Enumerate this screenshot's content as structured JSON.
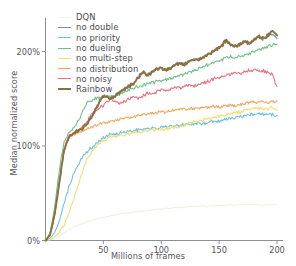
{
  "chart_data": {
    "type": "line",
    "title": "",
    "xlabel": "Millions of frames",
    "ylabel": "Median normalized score",
    "xlim": [
      0,
      200
    ],
    "ylim": [
      0,
      231
    ],
    "xticks": [
      50,
      100,
      150,
      200
    ],
    "xtick_labels": [
      "50",
      "100",
      "150",
      "200"
    ],
    "yticks": [
      0,
      100,
      200
    ],
    "ytick_labels": [
      "0%",
      "100%",
      "200%"
    ],
    "grid": false,
    "legend_position": "upper-left",
    "x": [
      0,
      4,
      8,
      12,
      16,
      20,
      24,
      28,
      32,
      36,
      40,
      44,
      48,
      52,
      56,
      60,
      64,
      68,
      72,
      76,
      80,
      84,
      88,
      92,
      96,
      100,
      104,
      108,
      112,
      116,
      120,
      124,
      128,
      132,
      136,
      140,
      144,
      148,
      152,
      156,
      160,
      164,
      168,
      172,
      176,
      180,
      184,
      188,
      192,
      196,
      200
    ],
    "series": [
      {
        "name": "DQN",
        "color": "#f4f1e4",
        "width": 1.2,
        "values": [
          0,
          1,
          3,
          5,
          8,
          11,
          14,
          16,
          18,
          20,
          21,
          23,
          24,
          25,
          26,
          27,
          28,
          29,
          29,
          30,
          31,
          31,
          32,
          32,
          33,
          33,
          34,
          34,
          35,
          35,
          35,
          36,
          36,
          36,
          37,
          36,
          37,
          37,
          37,
          37,
          38,
          37,
          38,
          38,
          38,
          38,
          38,
          37,
          38,
          38,
          38
        ]
      },
      {
        "name": "no double",
        "color": "#7a8fa6",
        "width": 1.1,
        "values": [
          0,
          6,
          28,
          62,
          95,
          110,
          113,
          116,
          119,
          124,
          131,
          141,
          150,
          153,
          150,
          152,
          157,
          160,
          163,
          166,
          172,
          178,
          175,
          178,
          181,
          183,
          180,
          183,
          186,
          188,
          186,
          189,
          192,
          191,
          193,
          196,
          199,
          203,
          206,
          212,
          207,
          205,
          208,
          211,
          209,
          212,
          215,
          213,
          216,
          219,
          214
        ]
      },
      {
        "name": "no priority",
        "color": "#6fc3e0",
        "width": 1.1,
        "values": [
          0,
          2,
          8,
          20,
          38,
          56,
          70,
          80,
          88,
          94,
          99,
          103,
          107,
          110,
          112,
          113,
          114,
          115,
          115,
          116,
          117,
          117,
          118,
          119,
          119,
          120,
          120,
          121,
          121,
          122,
          122,
          123,
          123,
          124,
          124,
          125,
          126,
          126,
          127,
          128,
          129,
          130,
          131,
          132,
          133,
          133,
          134,
          134,
          133,
          133,
          132
        ]
      },
      {
        "name": "no dueling",
        "color": "#72c18a",
        "width": 1.1,
        "values": [
          0,
          8,
          36,
          76,
          104,
          113,
          118,
          126,
          136,
          146,
          149,
          151,
          152,
          152,
          152,
          154,
          155,
          157,
          159,
          161,
          163,
          164,
          166,
          167,
          168,
          169,
          170,
          172,
          173,
          175,
          176,
          178,
          180,
          182,
          184,
          186,
          188,
          190,
          192,
          193,
          194,
          194,
          195,
          196,
          198,
          200,
          202,
          203,
          205,
          207,
          208
        ]
      },
      {
        "name": "no multi-step",
        "color": "#f3dd74",
        "width": 1.1,
        "values": [
          0,
          1,
          4,
          9,
          17,
          28,
          42,
          58,
          74,
          86,
          94,
          100,
          104,
          107,
          109,
          110,
          111,
          112,
          113,
          114,
          114,
          115,
          116,
          117,
          117,
          118,
          118,
          119,
          120,
          121,
          122,
          124,
          125,
          126,
          127,
          129,
          130,
          131,
          132,
          133,
          134,
          135,
          136,
          138,
          139,
          140,
          140,
          139,
          140,
          140,
          139
        ]
      },
      {
        "name": "no distribution",
        "color": "#eeaa63",
        "width": 1.1,
        "values": [
          0,
          6,
          28,
          62,
          96,
          110,
          112,
          114,
          116,
          118,
          120,
          122,
          124,
          125,
          126,
          127,
          128,
          129,
          130,
          131,
          132,
          133,
          134,
          135,
          135,
          136,
          136,
          137,
          138,
          139,
          139,
          139,
          140,
          140,
          141,
          141,
          142,
          141,
          142,
          143,
          143,
          143,
          144,
          145,
          146,
          147,
          147,
          147,
          146,
          147,
          146
        ]
      },
      {
        "name": "no noisy",
        "color": "#e5737e",
        "width": 1.1,
        "values": [
          0,
          6,
          28,
          62,
          96,
          110,
          113,
          116,
          120,
          126,
          134,
          138,
          141,
          146,
          149,
          147,
          145,
          147,
          150,
          152,
          151,
          153,
          156,
          155,
          157,
          160,
          158,
          160,
          162,
          161,
          163,
          164,
          163,
          165,
          167,
          168,
          170,
          172,
          173,
          175,
          176,
          178,
          177,
          179,
          180,
          181,
          179,
          180,
          178,
          176,
          162
        ]
      },
      {
        "name": "Rainbow",
        "color": "#8c6f3f",
        "width": 1.9,
        "values": [
          0,
          6,
          28,
          62,
          95,
          110,
          113,
          116,
          119,
          124,
          131,
          141,
          150,
          153,
          150,
          152,
          157,
          160,
          163,
          166,
          172,
          178,
          175,
          178,
          181,
          183,
          180,
          183,
          186,
          188,
          186,
          189,
          192,
          191,
          193,
          196,
          199,
          203,
          206,
          212,
          207,
          205,
          208,
          211,
          209,
          212,
          216,
          214,
          217,
          221,
          217
        ]
      }
    ]
  },
  "legend": {
    "entries": [
      {
        "label": "DQN"
      },
      {
        "label": "no double"
      },
      {
        "label": "no priority"
      },
      {
        "label": "no dueling"
      },
      {
        "label": "no multi-step"
      },
      {
        "label": "no distribution"
      },
      {
        "label": "no noisy"
      },
      {
        "label": "Rainbow"
      }
    ]
  },
  "axes": {
    "x_label": "Millions of frames",
    "y_label": "Median normalized score",
    "x_tick_labels": [
      "50",
      "100",
      "150",
      "200"
    ],
    "y_tick_labels": [
      "0%",
      "100%",
      "200%"
    ]
  },
  "colors": {
    "axis": "#8e8e96",
    "text": "#55555d"
  }
}
